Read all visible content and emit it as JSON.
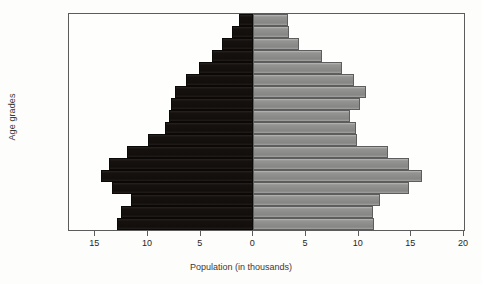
{
  "chart_data": {
    "type": "bar",
    "subtype": "population-pyramid",
    "title": "",
    "xlabel": "Population (in thousands)",
    "ylabel": "Age grades",
    "grid": false,
    "legend": null,
    "orientation": "horizontal",
    "categories": [
      "0–4",
      "5–9",
      "10–14",
      "15–19",
      "20–24",
      "25–29",
      "30–34",
      "35–39",
      "40–44",
      "45–49",
      "50–54",
      "55–59",
      "60–64",
      "65–69",
      "70–74",
      "75–79",
      "80–84",
      "85+"
    ],
    "axis": {
      "tick_values": [
        15,
        10,
        5,
        0,
        5,
        10,
        15,
        20
      ],
      "left_max": 17.5,
      "right_max": 20,
      "units": "thousands"
    },
    "series": [
      {
        "name": "left",
        "side": "left",
        "color": "#171310",
        "values": [
          12.9,
          12.6,
          11.6,
          13.4,
          14.5,
          13.7,
          12.0,
          10.0,
          8.4,
          8.0,
          7.8,
          7.4,
          6.4,
          5.2,
          3.9,
          3.0,
          2.0,
          1.4
        ]
      },
      {
        "name": "right",
        "side": "right",
        "color": "#8d8d8d",
        "values": [
          11.5,
          11.4,
          12.0,
          14.8,
          16.0,
          14.8,
          12.8,
          9.8,
          9.7,
          9.2,
          10.1,
          10.7,
          9.6,
          8.4,
          6.5,
          4.3,
          3.4,
          3.3
        ]
      }
    ]
  },
  "chart": {
    "ylabel": "Age grades",
    "xlabel": "Population (in thousands)"
  }
}
